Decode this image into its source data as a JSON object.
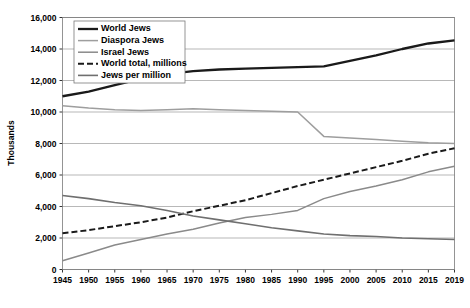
{
  "chart_data": {
    "type": "line",
    "title": "",
    "xlabel": "",
    "ylabel": "Thousands",
    "xlim": [
      1945,
      2019
    ],
    "ylim": [
      0,
      16000
    ],
    "ytick_step": 2000,
    "grid": true,
    "legend_position": "top-left",
    "x": [
      1945,
      1950,
      1955,
      1960,
      1965,
      1970,
      1975,
      1980,
      1985,
      1990,
      1995,
      2000,
      2005,
      2010,
      2015,
      2019
    ],
    "categories": [
      "1945",
      "1950",
      "1955",
      "1960",
      "1965",
      "1970",
      "1975",
      "1980",
      "1985",
      "1990",
      "1995",
      "2000",
      "2005",
      "2010",
      "2015",
      "2019"
    ],
    "ytick_labels": [
      "0",
      "2,000",
      "4,000",
      "6,000",
      "8,000",
      "10,000",
      "12,000",
      "14,000",
      "16,000"
    ],
    "ytick_values": [
      0,
      2000,
      4000,
      6000,
      8000,
      10000,
      12000,
      14000,
      16000
    ],
    "series": [
      {
        "name": "World Jews",
        "color": "#1a1a1a",
        "width": 2.3,
        "dash": "",
        "values": [
          11000,
          11300,
          11700,
          12100,
          12400,
          12600,
          12700,
          12750,
          12800,
          12850,
          12900,
          13250,
          13600,
          14000,
          14350,
          14550
        ]
      },
      {
        "name": "Diaspora Jews",
        "color": "#9e9e9e",
        "width": 1.5,
        "dash": "",
        "values": [
          10400,
          10250,
          10150,
          10100,
          10150,
          10200,
          10150,
          10100,
          10050,
          10000,
          8450,
          8350,
          8250,
          8150,
          8050,
          8000
        ]
      },
      {
        "name": "Israel Jews",
        "color": "#8a8a8a",
        "width": 1.5,
        "dash": "",
        "values": [
          550,
          1050,
          1550,
          1900,
          2250,
          2550,
          2950,
          3300,
          3500,
          3750,
          4500,
          4950,
          5300,
          5700,
          6200,
          6550
        ]
      },
      {
        "name": "World total, millions",
        "color": "#1a1a1a",
        "width": 2.0,
        "dash": "6,3",
        "values": [
          2300,
          2500,
          2750,
          3000,
          3300,
          3700,
          4050,
          4400,
          4850,
          5300,
          5700,
          6100,
          6500,
          6900,
          7350,
          7700
        ]
      },
      {
        "name": "Jews per million",
        "color": "#6f6f6f",
        "width": 1.6,
        "dash": "",
        "values": [
          4700,
          4500,
          4250,
          4050,
          3750,
          3400,
          3150,
          2900,
          2650,
          2450,
          2250,
          2150,
          2100,
          2000,
          1950,
          1900
        ]
      }
    ]
  },
  "legend": {
    "items": [
      {
        "label": "World Jews"
      },
      {
        "label": "Diaspora Jews"
      },
      {
        "label": "Israel Jews"
      },
      {
        "label": "World total, millions"
      },
      {
        "label": "Jews per million"
      }
    ]
  }
}
